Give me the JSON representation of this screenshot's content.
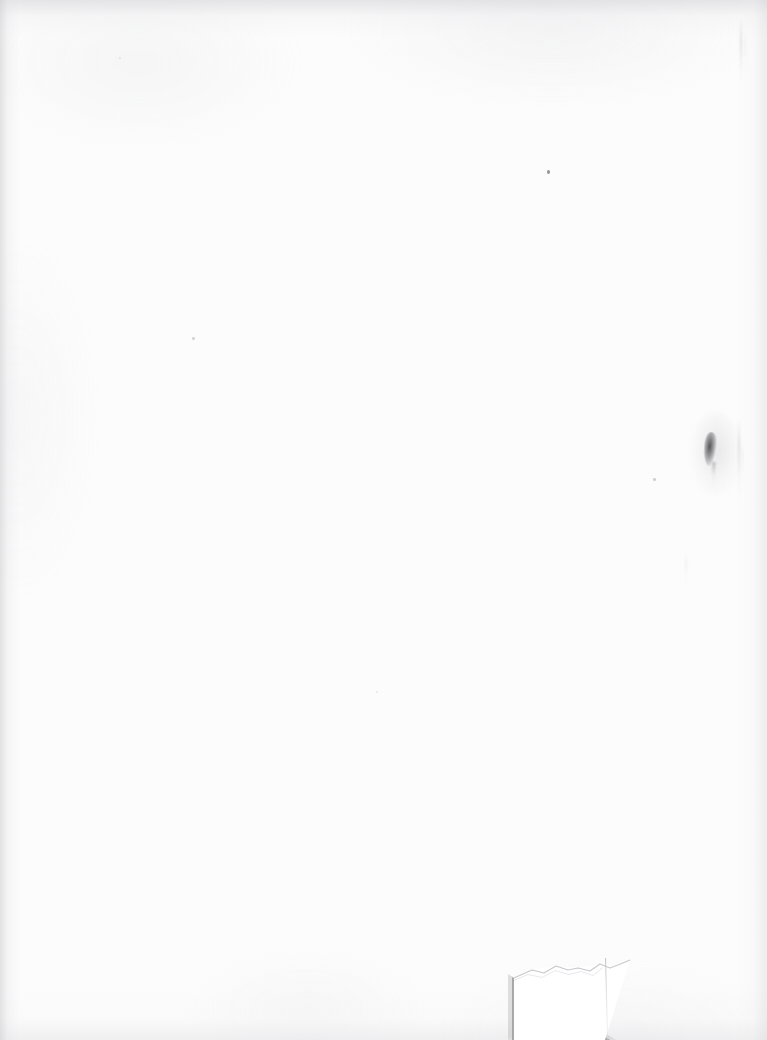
{
  "document": {
    "kind": "scanned-page",
    "page_state": "blank",
    "width": 767,
    "height": 1040,
    "visible_text": "",
    "caption": ""
  },
  "colors": {
    "paper": "#fcfcfc",
    "page_background": "#ffffff",
    "flap_white": "#ffffff",
    "fold_shadow_gray": "#a8a8a8",
    "smudge_dark": "#404042",
    "edge_shade": "#cdced2",
    "crease_line": "#bababe"
  },
  "artifacts": {
    "ink_smudge": {
      "name": "ink-smudge",
      "x": 710,
      "y": 449,
      "width": 12,
      "height": 34,
      "color": "#404042"
    },
    "specks": [
      {
        "name": "speck-upper-center-right",
        "x": 548,
        "y": 171,
        "size": 3,
        "opacity": 0.55
      },
      {
        "name": "speck-left-middle",
        "x": 193,
        "y": 338,
        "size": 2.5,
        "opacity": 0.3
      },
      {
        "name": "speck-right-middle",
        "x": 654,
        "y": 479,
        "size": 2.5,
        "opacity": 0.32
      },
      {
        "name": "speck-lower-center",
        "x": 377,
        "y": 692,
        "size": 2,
        "opacity": 0.18
      },
      {
        "name": "speck-top-left",
        "x": 120,
        "y": 58,
        "size": 2,
        "opacity": 0.2
      }
    ],
    "streaks": [
      {
        "name": "streak-top-right-outer",
        "x": 740,
        "y": 18,
        "height": 72
      },
      {
        "name": "streak-top-right-inner",
        "x": 745,
        "y": 30,
        "height": 46
      },
      {
        "name": "streak-right-outer",
        "x": 738,
        "y": 418,
        "height": 86
      },
      {
        "name": "streak-right-inner",
        "x": 742,
        "y": 438,
        "height": 54
      },
      {
        "name": "streak-right-lower",
        "x": 685,
        "y": 552,
        "height": 36
      }
    ],
    "torn_corner": {
      "name": "torn-page-corner",
      "x": 498,
      "y": 952,
      "width": 269,
      "height": 88,
      "shadow_color": "#a8a8a8",
      "flap_color": "#ffffff",
      "crease_x": 605
    }
  }
}
